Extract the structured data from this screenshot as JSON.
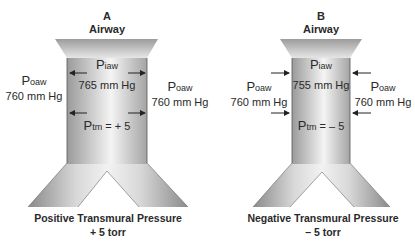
{
  "panels": [
    {
      "letter": "A",
      "title": "Airway",
      "inside": {
        "symbol": "P",
        "subscript": "iaw",
        "value": "765 mm Hg"
      },
      "outside_left": {
        "symbol": "P",
        "subscript": "oaw",
        "value": "760 mm Hg"
      },
      "outside_right": {
        "symbol": "P",
        "subscript": "oaw",
        "value": "760 mm Hg"
      },
      "transmural": {
        "symbol": "P",
        "subscript": "tm",
        "equation": " = + 5"
      },
      "arrow_direction": "outward",
      "caption_line1": "Positive Transmural Pressure",
      "caption_line2": "+ 5 torr"
    },
    {
      "letter": "B",
      "title": "Airway",
      "inside": {
        "symbol": "P",
        "subscript": "iaw",
        "value": "755 mm Hg"
      },
      "outside_left": {
        "symbol": "P",
        "subscript": "oaw",
        "value": "760 mm Hg"
      },
      "outside_right": {
        "symbol": "P",
        "subscript": "oaw",
        "value": "760 mm Hg"
      },
      "transmural": {
        "symbol": "P",
        "subscript": "tm",
        "equation": " = – 5"
      },
      "arrow_direction": "inward",
      "caption_line1": "Negative Transmural Pressure",
      "caption_line2": "– 5 torr"
    }
  ],
  "colors": {
    "airway_light": "#f2f2f2",
    "airway_dark": "#8c8c8c",
    "text": "#2a2a2a"
  }
}
